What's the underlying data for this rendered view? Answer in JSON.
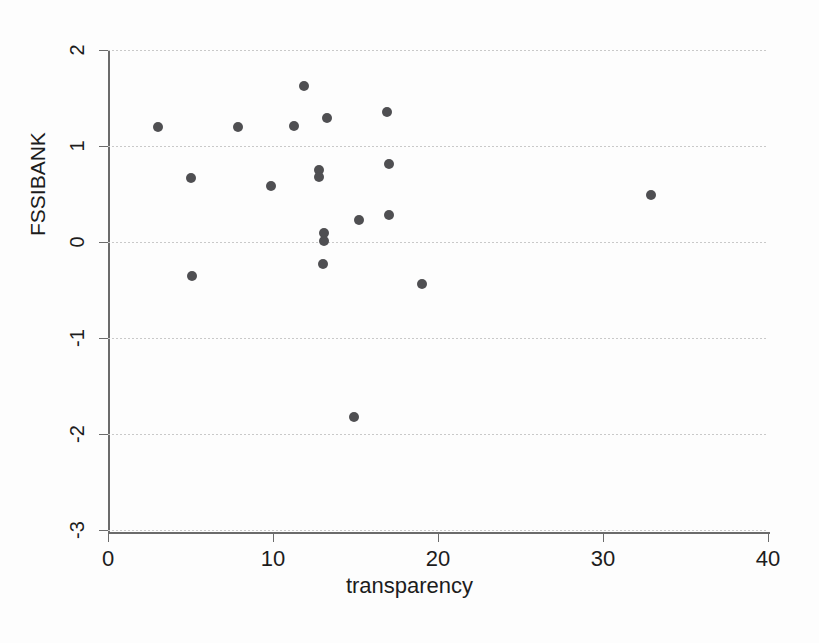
{
  "chart_data": {
    "type": "scatter",
    "title": "",
    "xlabel": "transparency",
    "ylabel": "FSSIBANK",
    "xlim": [
      0,
      40
    ],
    "ylim": [
      -3,
      2
    ],
    "xticks": [
      0,
      10,
      20,
      30,
      40
    ],
    "yticks": [
      2,
      1,
      0,
      -1,
      -2,
      -3
    ],
    "xtick_labels": [
      "0",
      "10",
      "20",
      "30",
      "40"
    ],
    "ytick_labels": [
      "2",
      "1",
      "0",
      "-1",
      "-2",
      "-3"
    ],
    "grid": "horizontal-dotted",
    "legend": null,
    "marker": {
      "shape": "circle",
      "color": "#4f4f52",
      "size": 10
    },
    "points": [
      {
        "x": 3.0,
        "y": 1.2
      },
      {
        "x": 5.0,
        "y": 0.67
      },
      {
        "x": 5.1,
        "y": -0.35
      },
      {
        "x": 7.9,
        "y": 1.2
      },
      {
        "x": 9.9,
        "y": 0.58
      },
      {
        "x": 11.3,
        "y": 1.21
      },
      {
        "x": 11.9,
        "y": 1.63
      },
      {
        "x": 12.8,
        "y": 0.75
      },
      {
        "x": 12.8,
        "y": 0.68
      },
      {
        "x": 13.0,
        "y": -0.23
      },
      {
        "x": 13.1,
        "y": 0.09
      },
      {
        "x": 13.1,
        "y": 0.01
      },
      {
        "x": 13.3,
        "y": 1.29
      },
      {
        "x": 14.9,
        "y": -1.82
      },
      {
        "x": 15.2,
        "y": 0.23
      },
      {
        "x": 16.9,
        "y": 1.35
      },
      {
        "x": 17.0,
        "y": 0.81
      },
      {
        "x": 17.0,
        "y": 0.28
      },
      {
        "x": 19.0,
        "y": -0.44
      },
      {
        "x": 32.9,
        "y": 0.49
      }
    ]
  }
}
